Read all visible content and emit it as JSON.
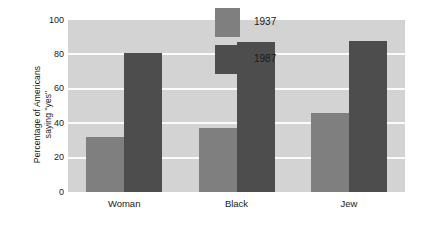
{
  "chart_data": {
    "type": "bar",
    "title": "",
    "subtitle": "",
    "xlabel": "",
    "ylabel": "Percentage of Americans\nsaying \"yes\"",
    "categories": [
      "Woman",
      "Black",
      "Jew"
    ],
    "series": [
      {
        "name": "1937",
        "color": "#7f7f7f",
        "values": [
          32,
          37,
          46
        ]
      },
      {
        "name": "1987",
        "color": "#4d4d4d",
        "values": [
          81,
          87,
          88
        ]
      }
    ],
    "ylim": [
      0,
      100
    ],
    "yticks": [
      0,
      20,
      40,
      60,
      80,
      100
    ],
    "ytick_labels": [
      "0",
      "20",
      "40",
      "60",
      "80",
      "100"
    ],
    "grid": true,
    "grid_axis": "y",
    "grid_color": "#fbfbfb",
    "legend_position": "inside-top-right",
    "plot_background": "#d3d3d3",
    "figure_background": "#ffffff"
  }
}
